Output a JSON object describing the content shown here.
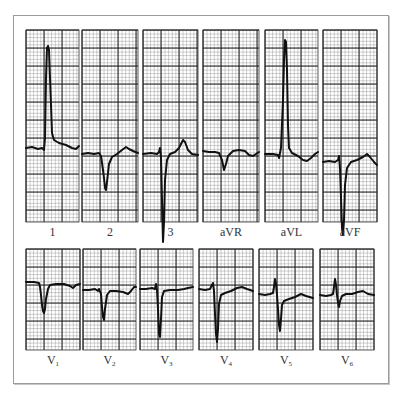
{
  "figure": {
    "colors": {
      "paper": "#ffffff",
      "grid_minor": "#5a5a5a",
      "grid_major": "#1a1a1a",
      "trace": "#111111",
      "frame": "#9a9a9a",
      "label": "#333333"
    },
    "rows": [
      {
        "name": "limb-leads",
        "panels": [
          {
            "id": "lead-1",
            "label": "1",
            "sub": "",
            "x": 26,
            "y": 30,
            "w": 53,
            "h": 192,
            "baseline": 118,
            "trace": [
              [
                0,
                118
              ],
              [
                6,
                117
              ],
              [
                12,
                119
              ],
              [
                16,
                118
              ],
              [
                18,
                120
              ],
              [
                19,
                108
              ],
              [
                20,
                48
              ],
              [
                21,
                18
              ],
              [
                22,
                16
              ],
              [
                23,
                20
              ],
              [
                25,
                75
              ],
              [
                26,
                103
              ],
              [
                28,
                110
              ],
              [
                33,
                113
              ],
              [
                40,
                115
              ],
              [
                46,
                118
              ],
              [
                50,
                119
              ],
              [
                53,
                116
              ]
            ]
          },
          {
            "id": "lead-2",
            "label": "2",
            "sub": "",
            "x": 82,
            "y": 30,
            "w": 56,
            "h": 192,
            "baseline": 124,
            "trace": [
              [
                0,
                124
              ],
              [
                6,
                123
              ],
              [
                12,
                124
              ],
              [
                17,
                123
              ],
              [
                19,
                126
              ],
              [
                21,
                140
              ],
              [
                22,
                148
              ],
              [
                23,
                158
              ],
              [
                24,
                160
              ],
              [
                25,
                152
              ],
              [
                27,
                134
              ],
              [
                30,
                127
              ],
              [
                35,
                124
              ],
              [
                40,
                120
              ],
              [
                44,
                117
              ],
              [
                47,
                119
              ],
              [
                51,
                121
              ],
              [
                56,
                123
              ]
            ]
          },
          {
            "id": "lead-3",
            "label": "3",
            "sub": "",
            "x": 143,
            "y": 30,
            "w": 55,
            "h": 192,
            "baseline": 124,
            "trace": [
              [
                0,
                124
              ],
              [
                8,
                123
              ],
              [
                14,
                124
              ],
              [
                16,
                122
              ],
              [
                17,
                118
              ],
              [
                18,
                128
              ],
              [
                19,
                170
              ],
              [
                20,
                212
              ],
              [
                21,
                192
              ],
              [
                22,
                150
              ],
              [
                24,
                130
              ],
              [
                27,
                124
              ],
              [
                32,
                122
              ],
              [
                36,
                118
              ],
              [
                40,
                110
              ],
              [
                42,
                112
              ],
              [
                45,
                120
              ],
              [
                49,
                124
              ],
              [
                55,
                125
              ]
            ]
          },
          {
            "id": "lead-aVR",
            "label": "aVR",
            "sub": "",
            "x": 203,
            "y": 30,
            "w": 56,
            "h": 192,
            "baseline": 121,
            "trace": [
              [
                0,
                121
              ],
              [
                6,
                122
              ],
              [
                12,
                122
              ],
              [
                16,
                123
              ],
              [
                19,
                130
              ],
              [
                21,
                140
              ],
              [
                23,
                134
              ],
              [
                25,
                126
              ],
              [
                30,
                121
              ],
              [
                36,
                120
              ],
              [
                42,
                121
              ],
              [
                46,
                125
              ],
              [
                50,
                126
              ],
              [
                56,
                122
              ]
            ]
          },
          {
            "id": "lead-aVL",
            "label": "aVL",
            "sub": "",
            "x": 265,
            "y": 30,
            "w": 53,
            "h": 192,
            "baseline": 124,
            "trace": [
              [
                0,
                124
              ],
              [
                8,
                124
              ],
              [
                13,
                125
              ],
              [
                14,
                128
              ],
              [
                16,
                118
              ],
              [
                18,
                70
              ],
              [
                19,
                30
              ],
              [
                20,
                10
              ],
              [
                21,
                12
              ],
              [
                22,
                40
              ],
              [
                23,
                95
              ],
              [
                24,
                118
              ],
              [
                27,
                123
              ],
              [
                33,
                126
              ],
              [
                38,
                130
              ],
              [
                42,
                131
              ],
              [
                46,
                128
              ],
              [
                50,
                124
              ],
              [
                53,
                122
              ]
            ]
          },
          {
            "id": "lead-aVF",
            "label": "aVF",
            "sub": "",
            "x": 323,
            "y": 30,
            "w": 54,
            "h": 192,
            "baseline": 132,
            "trace": [
              [
                0,
                132
              ],
              [
                6,
                131
              ],
              [
                12,
                132
              ],
              [
                15,
                130
              ],
              [
                16,
                126
              ],
              [
                17,
                138
              ],
              [
                18,
                168
              ],
              [
                19,
                198
              ],
              [
                20,
                205
              ],
              [
                21,
                190
              ],
              [
                22,
                155
              ],
              [
                24,
                138
              ],
              [
                28,
                132
              ],
              [
                34,
                130
              ],
              [
                40,
                127
              ],
              [
                44,
                124
              ],
              [
                47,
                127
              ],
              [
                51,
                132
              ],
              [
                54,
                135
              ]
            ]
          }
        ]
      },
      {
        "name": "chest-leads",
        "panels": [
          {
            "id": "lead-V1",
            "label": "V",
            "sub": "1",
            "x": 26,
            "y": 249,
            "w": 54,
            "h": 101,
            "baseline": 33,
            "trace": [
              [
                0,
                33
              ],
              [
                8,
                33
              ],
              [
                13,
                34
              ],
              [
                14,
                38
              ],
              [
                15,
                46
              ],
              [
                16,
                56
              ],
              [
                17,
                62
              ],
              [
                18,
                64
              ],
              [
                19,
                60
              ],
              [
                20,
                50
              ],
              [
                22,
                40
              ],
              [
                24,
                36
              ],
              [
                30,
                35
              ],
              [
                38,
                35
              ],
              [
                44,
                37
              ],
              [
                47,
                39
              ],
              [
                50,
                36
              ],
              [
                54,
                35
              ]
            ]
          },
          {
            "id": "lead-V2",
            "label": "V",
            "sub": "2",
            "x": 83,
            "y": 249,
            "w": 53,
            "h": 101,
            "baseline": 41,
            "trace": [
              [
                0,
                41
              ],
              [
                6,
                41
              ],
              [
                12,
                40
              ],
              [
                15,
                42
              ],
              [
                16,
                40
              ],
              [
                18,
                45
              ],
              [
                19,
                58
              ],
              [
                20,
                68
              ],
              [
                21,
                71
              ],
              [
                22,
                60
              ],
              [
                24,
                46
              ],
              [
                27,
                42
              ],
              [
                33,
                42
              ],
              [
                40,
                43
              ],
              [
                45,
                45
              ],
              [
                48,
                42
              ],
              [
                51,
                38
              ],
              [
                53,
                38
              ]
            ]
          },
          {
            "id": "lead-V3",
            "label": "V",
            "sub": "3",
            "x": 140,
            "y": 249,
            "w": 53,
            "h": 101,
            "baseline": 40,
            "trace": [
              [
                0,
                40
              ],
              [
                6,
                40
              ],
              [
                12,
                39
              ],
              [
                15,
                40
              ],
              [
                16,
                35
              ],
              [
                17,
                41
              ],
              [
                18,
                60
              ],
              [
                19,
                85
              ],
              [
                20,
                88
              ],
              [
                21,
                70
              ],
              [
                22,
                48
              ],
              [
                24,
                42
              ],
              [
                30,
                41
              ],
              [
                38,
                41
              ],
              [
                44,
                40
              ],
              [
                48,
                39
              ],
              [
                53,
                38
              ]
            ]
          },
          {
            "id": "lead-V4",
            "label": "V",
            "sub": "4",
            "x": 199,
            "y": 249,
            "w": 54,
            "h": 101,
            "baseline": 40,
            "trace": [
              [
                0,
                40
              ],
              [
                6,
                41
              ],
              [
                11,
                40
              ],
              [
                13,
                36
              ],
              [
                14,
                34
              ],
              [
                15,
                42
              ],
              [
                16,
                65
              ],
              [
                17,
                85
              ],
              [
                18,
                93
              ],
              [
                19,
                80
              ],
              [
                20,
                55
              ],
              [
                22,
                46
              ],
              [
                26,
                44
              ],
              [
                32,
                42
              ],
              [
                38,
                39
              ],
              [
                43,
                38
              ],
              [
                48,
                40
              ],
              [
                54,
                42
              ]
            ]
          },
          {
            "id": "lead-V5",
            "label": "V",
            "sub": "5",
            "x": 259,
            "y": 249,
            "w": 54,
            "h": 101,
            "baseline": 45,
            "trace": [
              [
                0,
                45
              ],
              [
                6,
                46
              ],
              [
                11,
                45
              ],
              [
                14,
                44
              ],
              [
                15,
                38
              ],
              [
                16,
                30
              ],
              [
                17,
                35
              ],
              [
                18,
                46
              ],
              [
                19,
                60
              ],
              [
                20,
                76
              ],
              [
                21,
                82
              ],
              [
                22,
                70
              ],
              [
                23,
                56
              ],
              [
                25,
                52
              ],
              [
                30,
                50
              ],
              [
                36,
                48
              ],
              [
                42,
                45
              ],
              [
                47,
                47
              ],
              [
                54,
                49
              ]
            ]
          },
          {
            "id": "lead-V6",
            "label": "V",
            "sub": "6",
            "x": 320,
            "y": 249,
            "w": 54,
            "h": 101,
            "baseline": 46,
            "trace": [
              [
                0,
                46
              ],
              [
                6,
                47
              ],
              [
                11,
                46
              ],
              [
                13,
                45
              ],
              [
                14,
                38
              ],
              [
                15,
                30
              ],
              [
                16,
                36
              ],
              [
                17,
                46
              ],
              [
                18,
                54
              ],
              [
                19,
                58
              ],
              [
                20,
                52
              ],
              [
                22,
                47
              ],
              [
                26,
                45
              ],
              [
                32,
                45
              ],
              [
                38,
                43
              ],
              [
                43,
                42
              ],
              [
                48,
                45
              ],
              [
                54,
                46
              ]
            ]
          }
        ]
      }
    ],
    "label_offset": 10
  }
}
